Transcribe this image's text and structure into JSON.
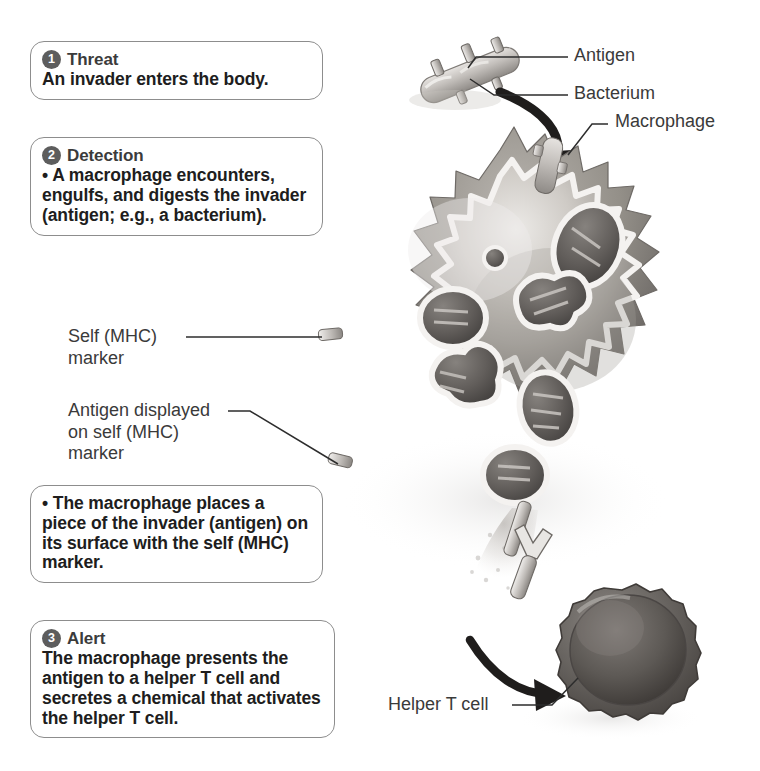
{
  "diagram": {
    "steps": [
      {
        "number": "1",
        "heading": "Threat",
        "body": "An invader enters the body."
      },
      {
        "number": "2",
        "heading": "Detection",
        "body": "• A macrophage encounters, engulfs, and digests the invader (antigen; e.g., a bacterium)."
      },
      {
        "number": "",
        "heading": "",
        "body": "• The macrophage places a piece of the invader (antigen) on its surface with the self (MHC) marker."
      },
      {
        "number": "3",
        "heading": "Alert",
        "body": "The macrophage presents the antigen to a helper T cell and secretes a chemical that activates the helper T cell."
      }
    ],
    "labels": {
      "antigen": "Antigen",
      "bacterium": "Bacterium",
      "macrophage": "Macrophage",
      "self_mhc_marker": "Self (MHC)\nmarker",
      "antigen_displayed": "Antigen displayed\non self (MHC)\nmarker",
      "helper_t_cell": "Helper T cell"
    },
    "colors": {
      "background": "#ffffff",
      "text": "#231f20",
      "heading_gray": "#3b3b3b",
      "badge_fill": "#5d5d5d",
      "box_border": "#8d8d8d",
      "leader_line": "#2d2d2d",
      "cell_light": "#d9d6d2",
      "cell_mid": "#a9a5a1",
      "cell_dark": "#6f6c69",
      "tcell_dark": "#5a5653",
      "membrane_highlight": "#f2f0ee"
    }
  }
}
